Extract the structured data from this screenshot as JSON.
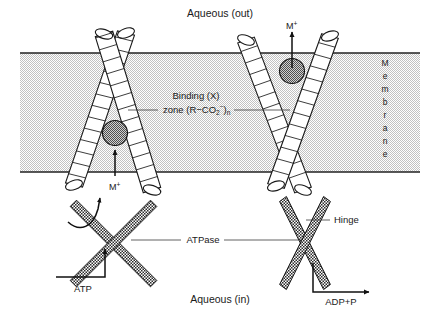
{
  "figure": {
    "width": 441,
    "height": 313,
    "background": "#ffffff"
  },
  "colors": {
    "membrane_fill": "#d9d9d9",
    "membrane_edge": "#222222",
    "helix_fill": "#ffffff",
    "helix_stroke": "#1a1a1a",
    "ion_fill": "#8c8c8c",
    "ion_stroke": "#111111",
    "atpase_fill": "#4a4a4a",
    "text": "#1a1a1a",
    "leader": "#3a3a3a"
  },
  "labels": {
    "aqueous_out": "Aqueous (out)",
    "aqueous_in": "Aqueous (in)",
    "binding_line1": "Binding (X)",
    "binding_line2_pre": "zone (R−CO",
    "binding_line2_sub": "2",
    "binding_line2_sup": "−",
    "binding_line2_close": ")",
    "binding_line2_n": "n",
    "atpase": "ATPase",
    "hinge": "Hinge",
    "atp": "ATP",
    "adp": "ADP+P",
    "ion_left": "M",
    "ion_left_charge": "+",
    "ion_right": "M",
    "ion_right_charge": "+",
    "membrane_letters": [
      "M",
      "e",
      "m",
      "b",
      "r",
      "a",
      "n",
      "e"
    ]
  },
  "membrane": {
    "top_y": 53,
    "bottom_y": 172,
    "left_x": 20,
    "right_x": 420,
    "fill": "#d9d9d9"
  },
  "helices": {
    "left_pair": [
      {
        "name": "left-helix-a",
        "x1": 74,
        "y1": 185,
        "x2": 126,
        "y2": 33,
        "radius": 9,
        "rungs": 13
      },
      {
        "name": "left-helix-b",
        "x1": 152,
        "y1": 190,
        "x2": 104,
        "y2": 34,
        "radius": 9,
        "rungs": 13
      }
    ],
    "right_pair": [
      {
        "name": "right-helix-a",
        "x1": 246,
        "y1": 40,
        "x2": 303,
        "y2": 190,
        "radius": 9,
        "rungs": 13
      },
      {
        "name": "right-helix-b",
        "x1": 330,
        "y1": 36,
        "x2": 276,
        "y2": 186,
        "radius": 9,
        "rungs": 13
      }
    ]
  },
  "ions": [
    {
      "name": "ion-left",
      "cx": 115,
      "cy": 133,
      "r": 12.5
    },
    {
      "name": "ion-right",
      "cx": 292,
      "cy": 71,
      "r": 12.5
    }
  ],
  "ion_arrows": [
    {
      "name": "ion-arrow-left",
      "x": 115,
      "y_from": 176,
      "y_to": 148
    },
    {
      "name": "ion-arrow-right",
      "x": 292,
      "y_from": 68,
      "y_to": 30
    }
  ],
  "atpase_units": [
    {
      "name": "atpase-left",
      "center_x": 113,
      "center_y": 243,
      "arms": [
        {
          "x1": 73,
          "y1": 203,
          "x2": 153,
          "y2": 283
        },
        {
          "x1": 153,
          "y1": 203,
          "x2": 73,
          "y2": 283
        }
      ]
    },
    {
      "name": "atpase-right",
      "center_x": 305,
      "center_y": 243,
      "arms": [
        {
          "x1": 283,
          "y1": 199,
          "x2": 327,
          "y2": 287
        },
        {
          "x1": 327,
          "y1": 199,
          "x2": 283,
          "y2": 287
        }
      ]
    }
  ],
  "leaders": {
    "binding_left": {
      "x1": 128,
      "y1": 110,
      "x2": 158,
      "y2": 110
    },
    "binding_right": {
      "x1": 232,
      "y1": 110,
      "x2": 288,
      "y2": 110
    },
    "atpase_left": {
      "x1": 131,
      "y1": 240,
      "x2": 180,
      "y2": 240
    },
    "atpase_right": {
      "x1": 222,
      "y1": 240,
      "x2": 300,
      "y2": 240
    },
    "hinge": {
      "x1": 306,
      "y1": 220,
      "x2": 330,
      "y2": 220
    }
  },
  "reaction_arrows": {
    "atp": {
      "points": "56,277 105,277 105,247",
      "label_x": 83,
      "label_y": 292
    },
    "adp": {
      "points": "313,263 313,292 371,292",
      "label_x": 335,
      "label_y": 305
    },
    "curved": {
      "path": "M 68,222 C 80,232 92,226 97,208 L 100,196"
    }
  },
  "membrane_label": {
    "x": 385,
    "y_start": 66,
    "line_height": 13
  }
}
